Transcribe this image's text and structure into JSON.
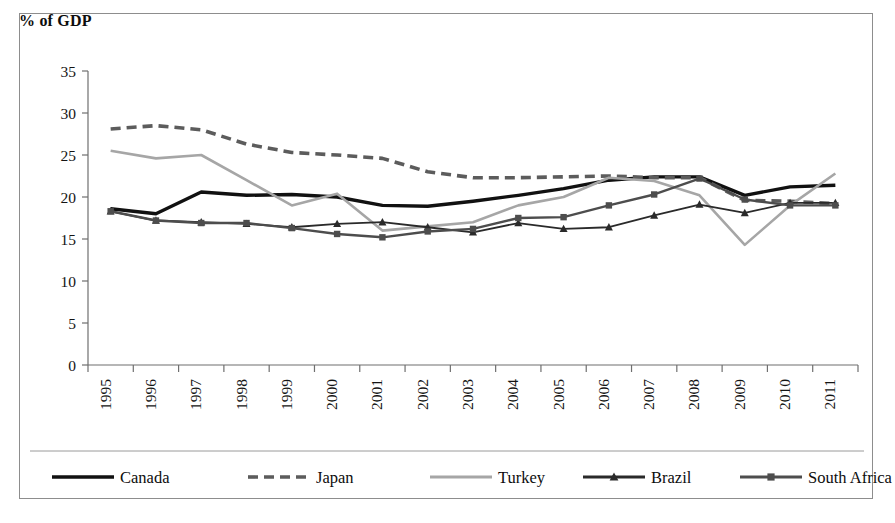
{
  "figure": {
    "y_axis_title": "% of GDP",
    "border_color": "#8d8d8d",
    "background": "#ffffff"
  },
  "chart_data": {
    "type": "line",
    "title": "",
    "subtitle": "",
    "xlabel": "",
    "ylabel": "% of GDP",
    "ylim": [
      0,
      35
    ],
    "yticks": [
      0,
      5,
      10,
      15,
      20,
      25,
      30,
      35
    ],
    "grid": false,
    "legend_position": "bottom",
    "x_tick_rotation": -90,
    "categories": [
      "1995",
      "1996",
      "1997",
      "1998",
      "1999",
      "2000",
      "2001",
      "2002",
      "2003",
      "2004",
      "2005",
      "2006",
      "2007",
      "2008",
      "2009",
      "2010",
      "2011"
    ],
    "series": [
      {
        "name": "Canada",
        "color": "#111111",
        "width": 3.4,
        "dash": "none",
        "marker": "none",
        "values": [
          18.6,
          18.0,
          20.6,
          20.2,
          20.3,
          20.0,
          19.0,
          18.9,
          19.5,
          20.2,
          21.0,
          22.0,
          22.4,
          22.4,
          20.2,
          21.2,
          21.4
        ]
      },
      {
        "name": "Japan",
        "color": "#5c5c5c",
        "width": 3.6,
        "dash": "10,6",
        "marker": "none",
        "values": [
          28.1,
          28.5,
          28.0,
          26.3,
          25.3,
          25.0,
          24.6,
          23.0,
          22.3,
          22.3,
          22.4,
          22.5,
          22.3,
          22.3,
          19.6,
          19.5,
          19.2
        ]
      },
      {
        "name": "Turkey",
        "color": "#a6a6a6",
        "width": 2.6,
        "dash": "none",
        "marker": "none",
        "values": [
          25.5,
          24.6,
          25.0,
          22.0,
          19.0,
          20.4,
          16.0,
          16.5,
          17.0,
          19.0,
          20.0,
          22.3,
          21.9,
          20.2,
          14.3,
          19.0,
          22.8
        ]
      },
      {
        "name": "Brazil",
        "color": "#2a2a2a",
        "width": 1.8,
        "dash": "none",
        "marker": "triangle",
        "values": [
          18.3,
          17.2,
          17.0,
          16.8,
          16.4,
          16.8,
          17.0,
          16.4,
          15.8,
          16.9,
          16.2,
          16.4,
          17.8,
          19.1,
          18.1,
          19.3,
          19.3
        ]
      },
      {
        "name": "South Africa",
        "color": "#4d4d4d",
        "width": 2.4,
        "dash": "none",
        "marker": "square",
        "values": [
          18.3,
          17.2,
          16.9,
          16.9,
          16.3,
          15.6,
          15.2,
          15.9,
          16.2,
          17.5,
          17.6,
          19.0,
          20.3,
          22.2,
          19.7,
          19.0,
          19.0
        ]
      }
    ]
  },
  "legend": {
    "items": [
      {
        "label": "Canada"
      },
      {
        "label": "Japan"
      },
      {
        "label": "Turkey"
      },
      {
        "label": "Brazil"
      },
      {
        "label": "South Africa"
      }
    ]
  }
}
